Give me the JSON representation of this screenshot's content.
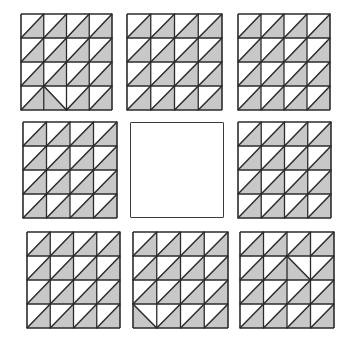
{
  "puzzle": {
    "type": "matrix-reasoning",
    "grid_rows": 3,
    "grid_cols": 3,
    "missing_cell": {
      "row": 2,
      "col": 2
    },
    "cell_pattern": {
      "rows": 4,
      "cols": 4,
      "default_diagonal": "slash",
      "shaded_triangle_default": "lower-right"
    },
    "colors": {
      "line": "#2b2b2b",
      "shade": "#c8c8c8",
      "background": "#ffffff"
    },
    "panels": [
      {
        "id": "p1",
        "row": 1,
        "col": 1,
        "x": 21,
        "y": 14,
        "w": 91,
        "h": 96,
        "blank": false,
        "anomalies": [
          {
            "r": 4,
            "c": 2,
            "diagonal": "backslash"
          }
        ]
      },
      {
        "id": "p2",
        "row": 1,
        "col": 2,
        "x": 127,
        "y": 14,
        "w": 95,
        "h": 96,
        "blank": false,
        "anomalies": []
      },
      {
        "id": "p3",
        "row": 1,
        "col": 3,
        "x": 238,
        "y": 14,
        "w": 92,
        "h": 96,
        "blank": false,
        "anomalies": []
      },
      {
        "id": "p4",
        "row": 2,
        "col": 1,
        "x": 23,
        "y": 122,
        "w": 94,
        "h": 96,
        "blank": false,
        "anomalies": []
      },
      {
        "id": "p5",
        "row": 2,
        "col": 2,
        "x": 130,
        "y": 122,
        "w": 94,
        "h": 96,
        "blank": true,
        "anomalies": []
      },
      {
        "id": "p6",
        "row": 2,
        "col": 3,
        "x": 238,
        "y": 122,
        "w": 93,
        "h": 96,
        "blank": false,
        "anomalies": []
      },
      {
        "id": "p7",
        "row": 3,
        "col": 1,
        "x": 27,
        "y": 232,
        "w": 93,
        "h": 96,
        "blank": false,
        "anomalies": []
      },
      {
        "id": "p8",
        "row": 3,
        "col": 2,
        "x": 133,
        "y": 232,
        "w": 95,
        "h": 96,
        "blank": false,
        "anomalies": [
          {
            "r": 4,
            "c": 1,
            "diagonal": "backslash"
          }
        ]
      },
      {
        "id": "p9",
        "row": 3,
        "col": 3,
        "x": 240,
        "y": 232,
        "w": 94,
        "h": 96,
        "blank": false,
        "anomalies": [
          {
            "r": 2,
            "c": 3,
            "diagonal": "backslash"
          }
        ]
      }
    ]
  }
}
